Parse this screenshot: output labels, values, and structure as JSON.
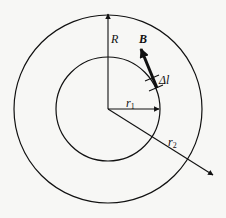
{
  "diagram": {
    "labels": {
      "R": "R",
      "B": "B",
      "delta_l": "Δl",
      "r1": "r",
      "r1_sub": "1",
      "r2": "r",
      "r2_sub": "2"
    },
    "colors": {
      "stroke": "#111111",
      "background": "#f7f7f5"
    }
  }
}
